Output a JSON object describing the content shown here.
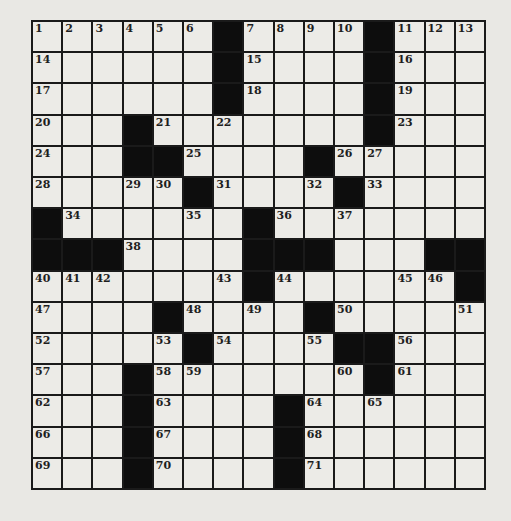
{
  "puzzle": {
    "size": {
      "rows": 15,
      "cols": 15
    },
    "grid": [
      "......#....#...",
      "......#....#...",
      "......#....#...",
      "...#.......#...",
      "...##....#.....",
      ".....#....#....",
      "#......#.......",
      "###....###...##",
      ".......#......#",
      "....#....#.....",
      ".....#....##...",
      "...#.......#...",
      "...#....#......",
      "...#....#......",
      "...#....#......"
    ],
    "numbers": [
      {
        "r": 0,
        "c": 0,
        "n": "1"
      },
      {
        "r": 0,
        "c": 1,
        "n": "2"
      },
      {
        "r": 0,
        "c": 2,
        "n": "3"
      },
      {
        "r": 0,
        "c": 3,
        "n": "4"
      },
      {
        "r": 0,
        "c": 4,
        "n": "5"
      },
      {
        "r": 0,
        "c": 5,
        "n": "6"
      },
      {
        "r": 0,
        "c": 7,
        "n": "7"
      },
      {
        "r": 0,
        "c": 8,
        "n": "8"
      },
      {
        "r": 0,
        "c": 9,
        "n": "9"
      },
      {
        "r": 0,
        "c": 10,
        "n": "10"
      },
      {
        "r": 0,
        "c": 12,
        "n": "11"
      },
      {
        "r": 0,
        "c": 13,
        "n": "12"
      },
      {
        "r": 0,
        "c": 14,
        "n": "13"
      },
      {
        "r": 1,
        "c": 0,
        "n": "14"
      },
      {
        "r": 1,
        "c": 7,
        "n": "15"
      },
      {
        "r": 1,
        "c": 12,
        "n": "16"
      },
      {
        "r": 2,
        "c": 0,
        "n": "17"
      },
      {
        "r": 2,
        "c": 7,
        "n": "18"
      },
      {
        "r": 2,
        "c": 12,
        "n": "19"
      },
      {
        "r": 3,
        "c": 0,
        "n": "20"
      },
      {
        "r": 3,
        "c": 4,
        "n": "21"
      },
      {
        "r": 3,
        "c": 6,
        "n": "22"
      },
      {
        "r": 3,
        "c": 12,
        "n": "23"
      },
      {
        "r": 4,
        "c": 0,
        "n": "24"
      },
      {
        "r": 4,
        "c": 5,
        "n": "25"
      },
      {
        "r": 4,
        "c": 10,
        "n": "26"
      },
      {
        "r": 4,
        "c": 11,
        "n": "27"
      },
      {
        "r": 5,
        "c": 0,
        "n": "28"
      },
      {
        "r": 5,
        "c": 3,
        "n": "29"
      },
      {
        "r": 5,
        "c": 4,
        "n": "30"
      },
      {
        "r": 5,
        "c": 6,
        "n": "31"
      },
      {
        "r": 5,
        "c": 9,
        "n": "32"
      },
      {
        "r": 5,
        "c": 11,
        "n": "33"
      },
      {
        "r": 6,
        "c": 1,
        "n": "34"
      },
      {
        "r": 6,
        "c": 5,
        "n": "35"
      },
      {
        "r": 6,
        "c": 8,
        "n": "36"
      },
      {
        "r": 6,
        "c": 10,
        "n": "37"
      },
      {
        "r": 7,
        "c": 3,
        "n": "38"
      },
      {
        "r": 7,
        "c": 9,
        "n": "39"
      },
      {
        "r": 8,
        "c": 0,
        "n": "40"
      },
      {
        "r": 8,
        "c": 1,
        "n": "41"
      },
      {
        "r": 8,
        "c": 2,
        "n": "42"
      },
      {
        "r": 8,
        "c": 6,
        "n": "43"
      },
      {
        "r": 8,
        "c": 8,
        "n": "44"
      },
      {
        "r": 8,
        "c": 12,
        "n": "45"
      },
      {
        "r": 8,
        "c": 13,
        "n": "46"
      },
      {
        "r": 9,
        "c": 0,
        "n": "47"
      },
      {
        "r": 9,
        "c": 5,
        "n": "48"
      },
      {
        "r": 9,
        "c": 7,
        "n": "49"
      },
      {
        "r": 9,
        "c": 10,
        "n": "50"
      },
      {
        "r": 9,
        "c": 14,
        "n": "51"
      },
      {
        "r": 10,
        "c": 0,
        "n": "52"
      },
      {
        "r": 10,
        "c": 4,
        "n": "53"
      },
      {
        "r": 10,
        "c": 6,
        "n": "54"
      },
      {
        "r": 10,
        "c": 9,
        "n": "55"
      },
      {
        "r": 10,
        "c": 12,
        "n": "56"
      },
      {
        "r": 11,
        "c": 0,
        "n": "57"
      },
      {
        "r": 11,
        "c": 4,
        "n": "58"
      },
      {
        "r": 11,
        "c": 5,
        "n": "59"
      },
      {
        "r": 11,
        "c": 10,
        "n": "60"
      },
      {
        "r": 11,
        "c": 12,
        "n": "61"
      },
      {
        "r": 12,
        "c": 0,
        "n": "62"
      },
      {
        "r": 12,
        "c": 4,
        "n": "63"
      },
      {
        "r": 12,
        "c": 9,
        "n": "64"
      },
      {
        "r": 12,
        "c": 11,
        "n": "65"
      },
      {
        "r": 13,
        "c": 0,
        "n": "66"
      },
      {
        "r": 13,
        "c": 4,
        "n": "67"
      },
      {
        "r": 13,
        "c": 9,
        "n": "68"
      },
      {
        "r": 14,
        "c": 0,
        "n": "69"
      },
      {
        "r": 14,
        "c": 4,
        "n": "70"
      },
      {
        "r": 14,
        "c": 9,
        "n": "71"
      }
    ]
  },
  "colors": {
    "paper": "#ecebe7",
    "block": "#0d0d0d",
    "line": "#1a1a1a"
  }
}
